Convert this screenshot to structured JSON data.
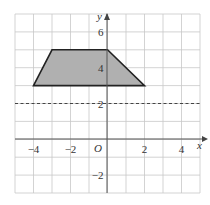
{
  "chart_data": {
    "type": "scatter",
    "title": "",
    "xlabel": "x",
    "ylabel": "y",
    "origin_label": "O",
    "xlim": [
      -5,
      5
    ],
    "ylim": [
      -3,
      7
    ],
    "grid": true,
    "x_ticks": [
      {
        "value": -4,
        "label": "−4"
      },
      {
        "value": -2,
        "label": "−2"
      },
      {
        "value": 2,
        "label": "2"
      },
      {
        "value": 4,
        "label": "4"
      }
    ],
    "y_ticks": [
      {
        "value": 6,
        "label": "6"
      },
      {
        "value": 4,
        "label": "4"
      },
      {
        "value": 2,
        "label": "2"
      },
      {
        "value": -2,
        "label": "−2"
      }
    ],
    "shapes": [
      {
        "name": "trapezium",
        "type": "polygon",
        "fill": "#b0b0b0",
        "stroke": "#222222",
        "vertices": [
          [
            -4,
            3
          ],
          [
            -3,
            5
          ],
          [
            0,
            5
          ],
          [
            2,
            3
          ]
        ]
      }
    ],
    "lines": [
      {
        "name": "dashed-line-y2",
        "type": "horizontal",
        "y": 2,
        "style": "dashed",
        "color": "#444444"
      }
    ]
  }
}
